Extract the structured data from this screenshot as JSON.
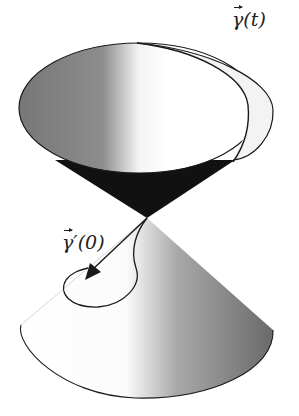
{
  "figure": {
    "labels": {
      "curve": {
        "symbol": "γ",
        "arg": "(t)"
      },
      "tangent": {
        "symbol": "γ",
        "prime": "′",
        "arg": "(0)"
      }
    },
    "colors": {
      "stroke": "#1a1a1a",
      "cone_dark": "#777777",
      "cone_light": "#ffffff",
      "inner_dark": "#111111"
    }
  }
}
